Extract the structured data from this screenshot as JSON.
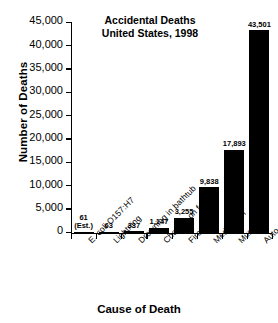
{
  "chart_data": {
    "type": "bar",
    "title": "Accidental Deaths\nUnited States, 1998",
    "title_line1": "Accidental Deaths",
    "title_line2": "United States, 1998",
    "xlabel": "Cause of Death",
    "ylabel": "Number of Deaths",
    "categories": [
      "E. coli O157:H7",
      "Lightning",
      "Drowning in bathtub",
      "Choking on food",
      "Fire",
      "Medication",
      "Murder",
      "Auto accidents"
    ],
    "values": [
      61,
      63,
      337,
      1147,
      3255,
      9838,
      17893,
      43501
    ],
    "value_labels": [
      "61",
      "63",
      "337",
      "1,147",
      "3,255",
      "9,838",
      "17,893",
      "43,501"
    ],
    "value_notes": [
      "(Est.)",
      "",
      "",
      "",
      "",
      "",
      "",
      ""
    ],
    "ylim": [
      0,
      45000
    ],
    "ytick_values": [
      0,
      5000,
      10000,
      15000,
      20000,
      25000,
      30000,
      35000,
      40000,
      45000
    ],
    "ytick_labels": [
      "0",
      "5,000",
      "10,000",
      "15,000",
      "20,000",
      "25,000",
      "30,000",
      "35,000",
      "40,000",
      "45,000"
    ],
    "grid": false,
    "legend": null,
    "bar_color": "#000000",
    "background_color": "#ffffff",
    "axis_color": "#000000"
  }
}
